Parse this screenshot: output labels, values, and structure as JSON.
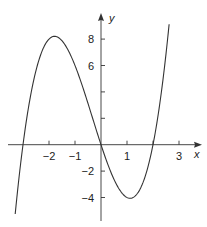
{
  "chart_data": {
    "type": "line",
    "title": "",
    "xlabel": "x",
    "ylabel": "y",
    "function": "y = x^3 + x^2 - 6x",
    "x_ticks": [
      -2,
      -1,
      1,
      3
    ],
    "x_tick_marks": [
      -2,
      -1,
      0,
      1,
      2,
      3
    ],
    "y_ticks": [
      8,
      6,
      -2,
      -4
    ],
    "y_tick_marks": [
      8,
      6,
      4,
      2,
      -2,
      -4
    ],
    "xlim": [
      -3.3,
      2.62
    ],
    "ylim": [
      -4.5,
      9.5
    ],
    "grid": false,
    "roots": [
      -3,
      0,
      2
    ],
    "local_max": {
      "x": -1.79,
      "y": 8.2
    },
    "local_min": {
      "x": 1.12,
      "y": -4.06
    },
    "series": [
      {
        "name": "f(x)",
        "x": [
          -3.3,
          -3,
          -2.5,
          -2,
          -1.79,
          -1.5,
          -1,
          -0.5,
          0,
          0.5,
          1,
          1.12,
          1.5,
          2,
          2.3,
          2.62
        ],
        "values": [
          -3.83,
          0,
          5.63,
          8,
          8.2,
          7.88,
          6,
          3.13,
          0,
          -2.63,
          -4,
          -4.06,
          -2.63,
          0,
          3.22,
          7.59
        ]
      }
    ]
  },
  "labels": {
    "x_axis": "x",
    "y_axis": "y",
    "x_ticks": [
      "−2",
      "−1",
      "1",
      "3"
    ],
    "y_ticks": [
      "8",
      "6",
      "−2",
      "−4"
    ]
  }
}
